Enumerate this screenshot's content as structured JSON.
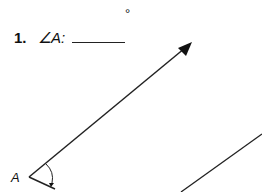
{
  "problem": {
    "number": "1.",
    "prompt": "∠A:",
    "degree_symbol": "°",
    "answer": ""
  },
  "figure": {
    "vertex_label": "A"
  }
}
